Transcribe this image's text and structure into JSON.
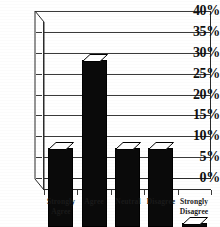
{
  "chart_data": {
    "type": "bar",
    "title": "",
    "xlabel": "",
    "ylabel": "",
    "categories": [
      "Strongly Agree",
      "Agree",
      "Neutral",
      "Disagree",
      "Strongly Disagree"
    ],
    "category_lines": [
      [
        "Strongly",
        "Agree"
      ],
      [
        "Agree"
      ],
      [
        "Neutral"
      ],
      [
        "Disagree"
      ],
      [
        "Strongly",
        "Disagree"
      ]
    ],
    "values": [
      19,
      40,
      19,
      19,
      1
    ],
    "value_labels": [
      "19%",
      "40%",
      "19%",
      "19%",
      "1%"
    ],
    "ylim": [
      0,
      40
    ],
    "ytick_values": [
      0,
      5,
      10,
      15,
      20,
      25,
      30,
      35,
      40
    ],
    "ytick_labels": [
      "0%",
      "5%",
      "10%",
      "15%",
      "20%",
      "25%",
      "30%",
      "35%",
      "40%"
    ],
    "grid": true,
    "legend": "none",
    "style": "3d-bar",
    "bar_color": "#0a0a0a",
    "bar_top_color": "#ffffff",
    "axis_color": "#2b2b2b",
    "grid_color": "#3a3a3a",
    "background": "#ffffff"
  }
}
